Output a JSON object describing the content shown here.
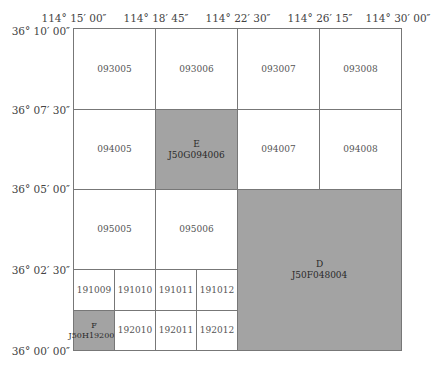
{
  "x_axis_labels": [
    "114° 15′ 00″",
    "114° 18′ 45″",
    "114° 22′ 30″",
    "114° 26′ 15″",
    "114° 30′ 00″"
  ],
  "y_axis_labels": [
    "36° 10′ 00″",
    "36° 07′ 30″",
    "36° 05′ 00″",
    "36° 02′ 30″",
    "36° 00′ 00″"
  ],
  "colors": {
    "highlight": "#a3a3a3",
    "grid_line": "#777777",
    "background": "#ffffff"
  },
  "cells": {
    "c093005": "093005",
    "c093006": "093006",
    "c093007": "093007",
    "c093008": "093008",
    "c094005": "094005",
    "E": {
      "letter": "E",
      "code": "J50G094006"
    },
    "c094007": "094007",
    "c094008": "094008",
    "c095005": "095005",
    "c095006": "095006",
    "D": {
      "letter": "D",
      "code": "J50F048004"
    },
    "c191009": "191009",
    "c191010": "191010",
    "c191011": "191011",
    "c191012": "191012",
    "F": {
      "letter": "F",
      "code": "J50H192009"
    },
    "c192010": "192010",
    "c192011": "192011",
    "c192012": "192012"
  }
}
